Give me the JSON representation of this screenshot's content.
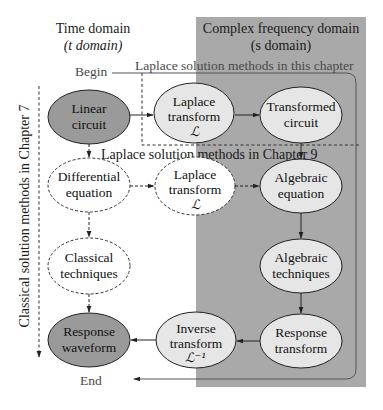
{
  "headers": {
    "time_domain": {
      "line1": "Time domain",
      "line2": "(t domain)"
    },
    "freq_domain": {
      "line1": "Complex frequency domain",
      "line2": "(s domain)"
    }
  },
  "labels": {
    "begin": "Begin",
    "end": "End",
    "laplace_this_chapter": "Laplace solution methods in this chapter",
    "laplace_chapter9": "Laplace solution methods in Chapter 9",
    "classical_chapter7": "Classical solution methods in Chapter 7"
  },
  "nodes": [
    {
      "id": "linear-circuit",
      "line1": "Linear",
      "line2": "circuit",
      "style": "dark",
      "cx": 89,
      "cy": 117,
      "rx": 41,
      "ry": 27
    },
    {
      "id": "laplace-transform-top",
      "line1": "Laplace",
      "line2": "transform",
      "line3": "ℒ",
      "style": "light",
      "cx": 194,
      "cy": 113,
      "rx": 40,
      "ry": 30
    },
    {
      "id": "transformed-circuit",
      "line1": "Transformed",
      "line2": "circuit",
      "style": "light",
      "cx": 301,
      "cy": 115,
      "rx": 41,
      "ry": 28
    },
    {
      "id": "differential-equation",
      "line1": "Differential",
      "line2": "equation",
      "style": "dashed",
      "cx": 89,
      "cy": 185,
      "rx": 41,
      "ry": 27
    },
    {
      "id": "laplace-transform-mid",
      "line1": "Laplace",
      "line2": "transform",
      "line3": "ℒ",
      "style": "dashed",
      "cx": 195,
      "cy": 186,
      "rx": 40,
      "ry": 29
    },
    {
      "id": "algebraic-equation",
      "line1": "Algebraic",
      "line2": "equation",
      "style": "light",
      "cx": 301,
      "cy": 186,
      "rx": 41,
      "ry": 27
    },
    {
      "id": "classical-techniques",
      "line1": "Classical",
      "line2": "techniques",
      "style": "dashed",
      "cx": 89,
      "cy": 266,
      "rx": 41,
      "ry": 28
    },
    {
      "id": "algebraic-techniques",
      "line1": "Algebraic",
      "line2": "techniques",
      "style": "light",
      "cx": 301,
      "cy": 266,
      "rx": 41,
      "ry": 27
    },
    {
      "id": "response-waveform",
      "line1": "Response",
      "line2": "waveform",
      "style": "dark",
      "cx": 89,
      "cy": 340,
      "rx": 41,
      "ry": 27
    },
    {
      "id": "inverse-transform",
      "line1": "Inverse",
      "line2": "transform",
      "line3": "ℒ⁻¹",
      "style": "light",
      "cx": 196,
      "cy": 340,
      "rx": 40,
      "ry": 28
    },
    {
      "id": "response-transform",
      "line1": "Response",
      "line2": "transform",
      "style": "light",
      "cx": 301,
      "cy": 341,
      "rx": 41,
      "ry": 27
    }
  ],
  "colors": {
    "s_domain_region": "#a9a9a9",
    "dark_node": "#9a9a9a",
    "light_node": "#e6e6e6",
    "stroke": "#222222",
    "muted_text": "#4a4a4a"
  }
}
